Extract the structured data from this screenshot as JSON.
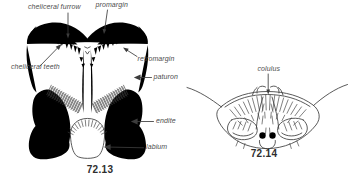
{
  "figure_left": {
    "caption": "72.13",
    "labels": {
      "cheliceral_furrow": "cheliceral furrow",
      "promargin": "promargin",
      "retromargin": "retromargin",
      "cheliceral_teeth": "cheliceral teeth",
      "paturon": "paturon",
      "endite": "endite",
      "labium": "labium"
    }
  },
  "figure_right": {
    "caption": "72.14",
    "labels": {
      "colulus": "colulus"
    }
  },
  "colors": {
    "ink": "#3c3c3c",
    "label_text": "#4d4d4d",
    "caption_text": "#2e2e2e",
    "background": "#ffffff"
  }
}
